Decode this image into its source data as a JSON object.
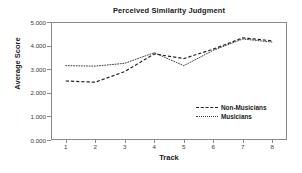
{
  "chart_data": {
    "type": "line",
    "title": "Perceived Similarity Judgment",
    "xlabel": "Track",
    "ylabel": "Average Score",
    "categories": [
      "1",
      "2",
      "3",
      "4",
      "5",
      "6",
      "7",
      "8"
    ],
    "x": [
      1,
      2,
      3,
      4,
      5,
      6,
      7,
      8
    ],
    "xlim": [
      0.5,
      8.5
    ],
    "ylim": [
      0.0,
      5.0
    ],
    "ytick_labels": [
      "0.000",
      "1.000",
      "2.000",
      "3.000",
      "4.000",
      "5.000"
    ],
    "ytick_values": [
      0.0,
      1.0,
      2.0,
      3.0,
      4.0,
      5.0
    ],
    "xtick_labels": [
      "1",
      "2",
      "3",
      "4",
      "5",
      "6",
      "7",
      "8"
    ],
    "grid": false,
    "legend_position": "lower-right-inside",
    "series": [
      {
        "name": "Non-Musicians",
        "style": "dashed",
        "color": "#222222",
        "values": [
          2.5,
          2.45,
          2.9,
          3.65,
          3.45,
          3.85,
          4.33,
          4.2
        ]
      },
      {
        "name": "Musicians",
        "style": "dotted",
        "color": "#444444",
        "values": [
          3.15,
          3.13,
          3.25,
          3.7,
          3.15,
          3.8,
          4.28,
          4.15
        ]
      }
    ]
  }
}
